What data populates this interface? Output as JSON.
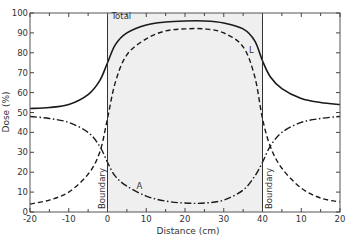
{
  "chart_data": {
    "type": "line",
    "title": "",
    "xlabel": "Distance (cm)",
    "ylabel": "Dose (%)",
    "xlim": [
      -20,
      60
    ],
    "ylim": [
      0,
      100
    ],
    "x_ticks": [
      -20,
      -10,
      0,
      10,
      20,
      30,
      40,
      50,
      60
    ],
    "x_tick_labels": [
      "-20",
      "-10",
      "0",
      "10",
      "20",
      "30",
      "40",
      "10",
      "20"
    ],
    "y_ticks": [
      0,
      10,
      20,
      30,
      40,
      50,
      60,
      70,
      80,
      90,
      100
    ],
    "y_tick_labels": [
      "0",
      "10",
      "20",
      "30",
      "40",
      "50",
      "60",
      "70",
      "80",
      "90",
      "100"
    ],
    "grid": false,
    "shaded_region": {
      "x_from": 0,
      "x_to": 40,
      "color": "#efefef"
    },
    "boundaries": [
      {
        "x": 0,
        "label": "Boundary"
      },
      {
        "x": 40,
        "label": "Boundary"
      }
    ],
    "series": [
      {
        "name": "Total",
        "style": "solid",
        "x": [
          -20,
          -15,
          -10,
          -5,
          -2,
          0,
          2,
          5,
          10,
          15,
          20,
          25,
          30,
          35,
          38,
          40,
          42,
          45,
          50,
          55,
          60
        ],
        "values": [
          52,
          52.5,
          54,
          59,
          66,
          75,
          84,
          90,
          94,
          95.5,
          96,
          96,
          95,
          92,
          86,
          76,
          68,
          62,
          57,
          55,
          54
        ]
      },
      {
        "name": "L",
        "style": "dashed",
        "x": [
          -20,
          -15,
          -10,
          -5,
          -2,
          0,
          2,
          5,
          10,
          15,
          20,
          25,
          30,
          35,
          38,
          40,
          42,
          45,
          50,
          55,
          60
        ],
        "values": [
          4,
          6,
          10,
          19,
          30,
          47,
          65,
          79,
          87,
          91,
          92,
          92,
          90,
          83,
          68,
          47,
          33,
          22,
          12,
          7,
          5
        ]
      },
      {
        "name": "A",
        "style": "dash-dot",
        "x": [
          -20,
          -15,
          -10,
          -5,
          -2,
          0,
          2,
          5,
          10,
          15,
          20,
          25,
          30,
          35,
          38,
          40,
          42,
          45,
          50,
          55,
          60
        ],
        "values": [
          48,
          47,
          45,
          40,
          33,
          25,
          18,
          13,
          8,
          5.5,
          4.5,
          4.5,
          6,
          11,
          18,
          25,
          33,
          40,
          45,
          47,
          48
        ]
      }
    ],
    "annotations": [
      {
        "text": "Total",
        "x": 1,
        "y": 97
      },
      {
        "text": "L",
        "x": 36.5,
        "y": 80
      },
      {
        "text": "A",
        "x": 7.5,
        "y": 11.5
      }
    ]
  }
}
